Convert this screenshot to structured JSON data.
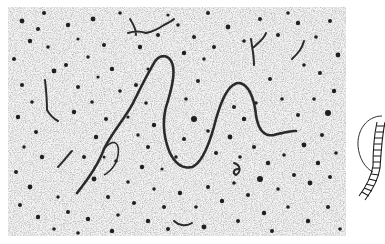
{
  "figure": {
    "panels": [
      {
        "id": "micrograph",
        "kind": "electron-micrograph",
        "subject": "DNA molecule strand with background particles",
        "colors": {
          "background": "#f1f1f1",
          "strand": "#2b2b2b",
          "particles": "#1e1e1e"
        }
      },
      {
        "id": "schematic",
        "kind": "diagram",
        "subject": "ladder-shaped DNA segment wrapping around a circular outline (cropped at right edge)",
        "colors": {
          "line": "#1a1a1a"
        }
      }
    ]
  }
}
